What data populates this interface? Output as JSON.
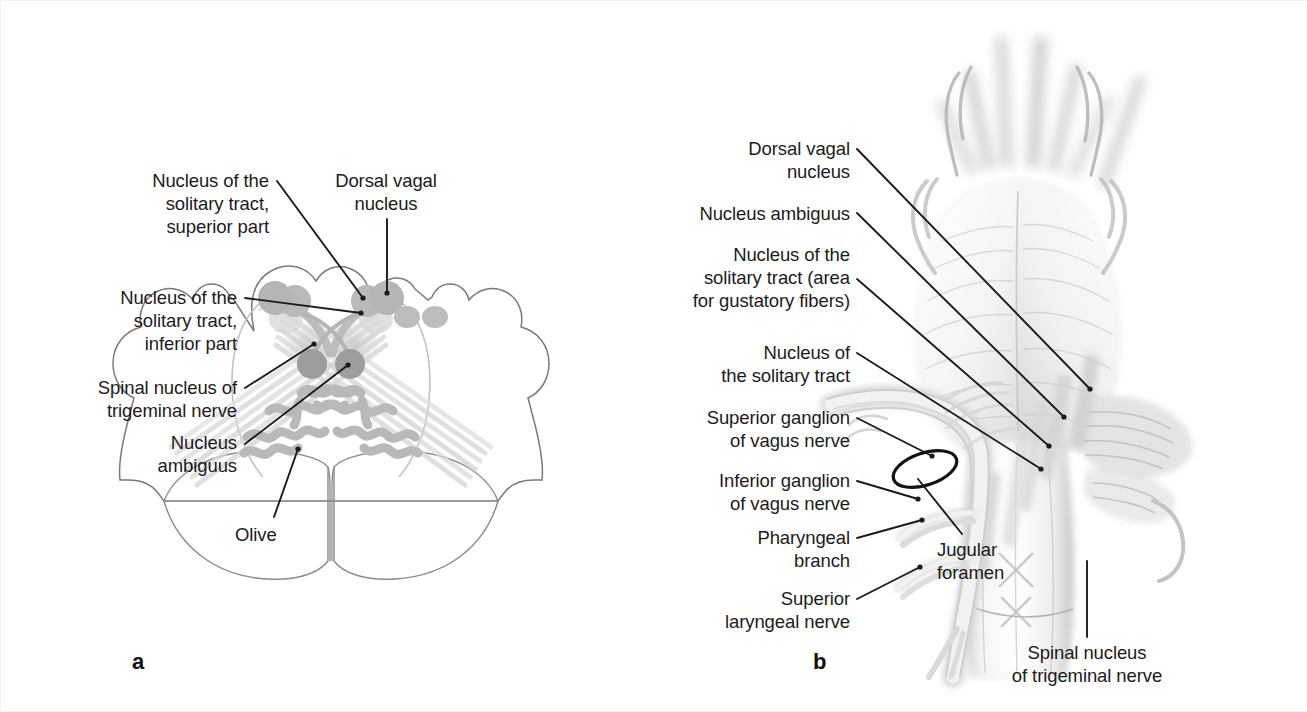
{
  "figure": {
    "panels": [
      {
        "id": "a",
        "letter": "a",
        "letter_pos": {
          "x": 131,
          "y": 648
        },
        "caption": "Cross section of the medulla oblongata showing the nuclei of the vagus nerve",
        "labels": [
          {
            "name": "nucleus-solitary-tract-superior",
            "text": "Nucleus of the\nsolitary tract,\nsuperior part",
            "align": "r",
            "x": 88,
            "y": 168,
            "w": 180,
            "leader": {
              "x1": 276,
              "y1": 180,
              "x2": 362,
              "y2": 297
            }
          },
          {
            "name": "dorsal-vagal-nucleus",
            "text": "Dorsal vagal\nnucleus",
            "align": "c",
            "x": 300,
            "y": 168,
            "w": 170,
            "leader": {
              "x1": 386,
              "y1": 218,
              "x2": 386,
              "y2": 294
            }
          },
          {
            "name": "nucleus-solitary-tract-inferior",
            "text": "Nucleus of the\nsolitary tract,\ninferior part",
            "align": "r",
            "x": 56,
            "y": 285,
            "w": 180,
            "leader": {
              "x1": 244,
              "y1": 297,
              "x2": 362,
              "y2": 311
            }
          },
          {
            "name": "spinal-nucleus-trigeminal-nerve",
            "text": "Spinal nucleus of\ntrigeminal nerve",
            "align": "r",
            "x": 32,
            "y": 375,
            "w": 204,
            "leader": {
              "x1": 244,
              "y1": 387,
              "x2": 315,
              "y2": 342
            }
          },
          {
            "name": "nucleus-ambiguus",
            "text": "Nucleus\nambiguus",
            "align": "r",
            "x": 96,
            "y": 430,
            "w": 140,
            "leader": {
              "x1": 244,
              "y1": 442,
              "x2": 349,
              "y2": 363
            }
          },
          {
            "name": "olive",
            "text": "Olive",
            "align": "l",
            "x": 234,
            "y": 522,
            "w": 90,
            "leader": {
              "x1": 276,
              "y1": 518,
              "x2": 298,
              "y2": 447
            }
          }
        ]
      },
      {
        "id": "b",
        "letter": "b",
        "letter_pos": {
          "x": 812,
          "y": 648
        },
        "caption": "Dorsal view of the brainstem with the course of the vagus nerve",
        "labels": [
          {
            "name": "dorsal-vagal-nucleus",
            "text": "Dorsal vagal\nnucleus",
            "align": "r",
            "x": 637,
            "y": 136,
            "w": 212,
            "leader": {
              "x1": 856,
              "y1": 148,
              "x2": 1089,
              "y2": 388
            }
          },
          {
            "name": "nucleus-ambiguus",
            "text": "Nucleus ambiguus",
            "align": "r",
            "x": 617,
            "y": 201,
            "w": 232,
            "leader": {
              "x1": 856,
              "y1": 212,
              "x2": 1063,
              "y2": 416
            }
          },
          {
            "name": "nucleus-solitary-tract-gustatory",
            "text": "Nucleus of the\nsolitary tract (area\nfor gustatory fibers)",
            "align": "r",
            "x": 604,
            "y": 242,
            "w": 245,
            "leader": {
              "x1": 856,
              "y1": 278,
              "x2": 1048,
              "y2": 445
            }
          },
          {
            "name": "nucleus-solitary-tract",
            "text": "Nucleus of\nthe solitary tract",
            "align": "r",
            "x": 648,
            "y": 340,
            "w": 201,
            "leader": {
              "x1": 856,
              "y1": 352,
              "x2": 1040,
              "y2": 468
            }
          },
          {
            "name": "superior-ganglion-vagus-nerve",
            "text": "Superior ganglion\nof vagus nerve",
            "align": "r",
            "x": 644,
            "y": 405,
            "w": 205,
            "leader": {
              "x1": 856,
              "y1": 417,
              "x2": 931,
              "y2": 455
            }
          },
          {
            "name": "inferior-ganglion-vagus-nerve",
            "text": "Inferior ganglion\nof vagus nerve",
            "align": "r",
            "x": 648,
            "y": 468,
            "w": 201,
            "leader": {
              "x1": 856,
              "y1": 480,
              "x2": 917,
              "y2": 498
            }
          },
          {
            "name": "jugular-foramen",
            "text": "Jugular\nforamen",
            "align": "l",
            "x": 936,
            "y": 537,
            "w": 120,
            "leader": {
              "x1": 961,
              "y1": 533,
              "x2": 917,
              "y2": 478
            }
          },
          {
            "name": "pharyngeal-branch",
            "text": "Pharyngeal\nbranch",
            "align": "r",
            "x": 690,
            "y": 525,
            "w": 159,
            "leader": {
              "x1": 856,
              "y1": 537,
              "x2": 862,
              "y2": 538
            }
          },
          {
            "name": "superior-laryngeal-nerve",
            "text": "Superior\nlaryngeal nerve",
            "align": "r",
            "x": 653,
            "y": 586,
            "w": 196,
            "leader": {
              "x1": 856,
              "y1": 598,
              "x2": 868,
              "y2": 573
            }
          },
          {
            "name": "spinal-nucleus-trigeminal-nerve",
            "text": "Spinal nucleus\nof trigeminal nerve",
            "align": "c",
            "x": 976,
            "y": 640,
            "w": 220,
            "leader": {
              "x1": 1086,
              "y1": 636,
              "x2": 1086,
              "y2": 560
            }
          }
        ]
      }
    ],
    "colors": {
      "background": "#ffffff",
      "leader_line": "#1b1b1b",
      "text": "#1b1b1b",
      "nucleus_fill": "#b8b8b8",
      "nucleus_fill_dark": "#9a9a9a",
      "outline": "#6b6b6b",
      "tract_fill": "#dcdcdc",
      "shading": "#cfcfcf"
    }
  }
}
